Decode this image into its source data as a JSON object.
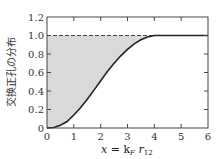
{
  "chart_data": {
    "type": "line",
    "title": "",
    "xlabel": "x = k_F r_12",
    "ylabel": "交换正孔の分布",
    "xlim": [
      0,
      6
    ],
    "ylim": [
      0,
      1.2
    ],
    "x_ticks": [
      "0",
      "1",
      "2",
      "3",
      "4",
      "5",
      "6"
    ],
    "y_ticks": [
      "0",
      "0.2",
      "0.4",
      "0.6",
      "0.8",
      "1.0",
      "1.2"
    ],
    "grid": false,
    "legend": null,
    "series": [
      {
        "name": "exchange hole distribution",
        "style": "solid",
        "x": [
          0,
          0.25,
          0.5,
          0.75,
          1.0,
          1.25,
          1.5,
          1.75,
          2.0,
          2.25,
          2.5,
          2.75,
          3.0,
          3.25,
          3.5,
          3.75,
          4.0,
          4.5,
          5.0,
          5.5,
          6.0
        ],
        "y": [
          0,
          0.005,
          0.03,
          0.07,
          0.14,
          0.22,
          0.31,
          0.41,
          0.51,
          0.61,
          0.7,
          0.78,
          0.85,
          0.91,
          0.955,
          0.985,
          1.0,
          1.0,
          1.0,
          1.0,
          1.0
        ]
      },
      {
        "name": "reference level 1.0",
        "style": "dashed",
        "x": [
          0,
          6
        ],
        "y": [
          1.0,
          1.0
        ]
      }
    ],
    "annotations": [
      "shaded region between curve and y=1.0 dashed line"
    ]
  },
  "labels": {
    "ylabel": "交换正孔の分布",
    "xlabel_main": "x",
    "xlabel_eq": " = k",
    "xlabel_sub1": "F",
    "xlabel_r": " r",
    "xlabel_sub2": "12"
  },
  "colors": {
    "curve": "#222222",
    "shade": "#d9d9d9",
    "axis": "#444444"
  }
}
